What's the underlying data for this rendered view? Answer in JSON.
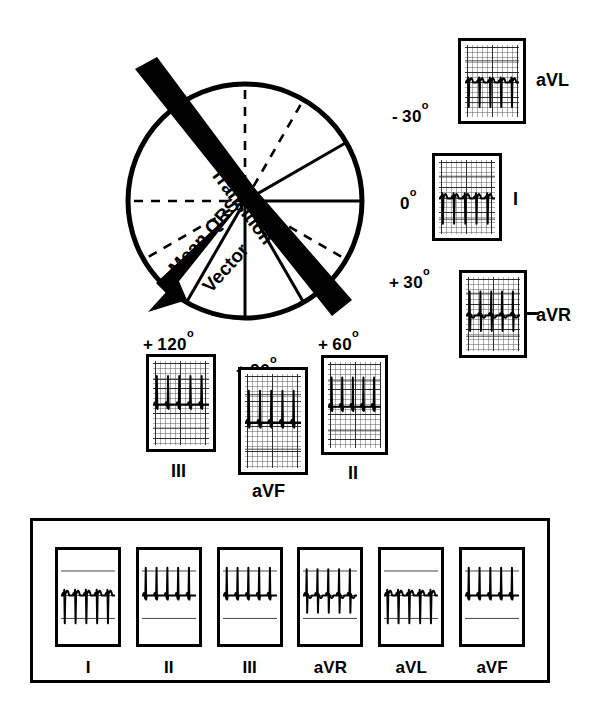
{
  "figure": {
    "circle": {
      "center_x": 245,
      "center_y": 201,
      "radius": 117,
      "mean_qrs_vector_label_1": "Mean QRS",
      "mean_qrs_vector_label_2": "Vector",
      "transition_label": "Transition",
      "mean_qrs_vector_angle_deg": 131,
      "transition_band_angle_deg": 41
    },
    "degree_labels": [
      {
        "name": "minus-30",
        "sign": "-",
        "value": "30",
        "unit": "o",
        "x": 392,
        "y": 106
      },
      {
        "name": "zero",
        "sign": "",
        "value": "0",
        "unit": "o",
        "x": 400,
        "y": 193
      },
      {
        "name": "plus-30",
        "sign": "+",
        "value": "30",
        "unit": "o",
        "x": 389,
        "y": 272
      },
      {
        "name": "plus-60",
        "sign": "+",
        "value": "60",
        "unit": "o",
        "x": 318,
        "y": 334
      },
      {
        "name": "plus-90",
        "sign": "+",
        "value": "90",
        "unit": "o",
        "x": 236,
        "y": 360
      },
      {
        "name": "plus-120",
        "sign": "+",
        "value": "120",
        "unit": "o",
        "x": 143,
        "y": 334
      }
    ],
    "radial_axes": [
      {
        "name": "axis-0-deg",
        "angle": 0,
        "style": "solid"
      },
      {
        "name": "axis-minus-30-deg",
        "angle": -30,
        "style": "solid"
      },
      {
        "name": "axis-minus-60-deg",
        "angle": -60,
        "style": "dashed"
      },
      {
        "name": "axis-minus-90-deg",
        "angle": -90,
        "style": "dashed"
      },
      {
        "name": "axis-180-deg",
        "angle": 180,
        "style": "dashed"
      },
      {
        "name": "axis-plus-150-deg",
        "angle": 150,
        "style": "dashed"
      },
      {
        "name": "axis-plus-120-deg",
        "angle": 120,
        "style": "solid"
      },
      {
        "name": "axis-plus-90-deg",
        "angle": 90,
        "style": "solid"
      },
      {
        "name": "axis-plus-60-deg",
        "angle": 60,
        "style": "solid"
      },
      {
        "name": "axis-plus-30-deg",
        "angle": 30,
        "style": "dashed"
      }
    ],
    "lead_strips": [
      {
        "name": "avl",
        "label": "aVL",
        "angle_deg": -30,
        "deflection": "negative",
        "strip_x": 458,
        "strip_y": 38,
        "strip_w": 68,
        "strip_h": 86,
        "label_x": 536,
        "label_y": 71
      },
      {
        "name": "lead-i",
        "label": "I",
        "angle_deg": 0,
        "deflection": "negative",
        "strip_x": 432,
        "strip_y": 153,
        "strip_w": 70,
        "strip_h": 88,
        "label_x": 513,
        "label_y": 190
      },
      {
        "name": "avr",
        "label": "aVR",
        "angle_deg": 30,
        "deflection": "biphasic",
        "strip_x": 459,
        "strip_y": 270,
        "strip_w": 68,
        "strip_h": 88,
        "label_x": 536,
        "label_y": 306
      },
      {
        "name": "lead-ii",
        "label": "II",
        "angle_deg": 60,
        "deflection": "positive",
        "strip_x": 321,
        "strip_y": 355,
        "strip_w": 67,
        "strip_h": 100,
        "label_x": 348,
        "label_y": 464
      },
      {
        "name": "avf",
        "label": "aVF",
        "angle_deg": 90,
        "deflection": "positive",
        "strip_x": 238,
        "strip_y": 367,
        "strip_w": 70,
        "strip_h": 108,
        "label_x": 252,
        "label_y": 482
      },
      {
        "name": "lead-iii",
        "label": "III",
        "angle_deg": 120,
        "deflection": "positive",
        "strip_x": 146,
        "strip_y": 354,
        "strip_w": 70,
        "strip_h": 98,
        "label_x": 171,
        "label_y": 462
      }
    ],
    "bottom_panel": {
      "x": 30,
      "y": 518,
      "w": 520,
      "h": 165,
      "strips": [
        {
          "name": "panel-lead-i",
          "label": "I",
          "deflection": "negative"
        },
        {
          "name": "panel-lead-ii",
          "label": "II",
          "deflection": "positive"
        },
        {
          "name": "panel-lead-iii",
          "label": "III",
          "deflection": "positive"
        },
        {
          "name": "panel-avr",
          "label": "aVR",
          "deflection": "biphasic"
        },
        {
          "name": "panel-avl",
          "label": "aVL",
          "deflection": "negative"
        },
        {
          "name": "panel-avf",
          "label": "aVF",
          "deflection": "positive"
        }
      ]
    },
    "colors": {
      "ink": "#000000",
      "paper": "#ffffff",
      "grid_major": "#282828",
      "grid_minor": "#5a5a5a"
    }
  }
}
